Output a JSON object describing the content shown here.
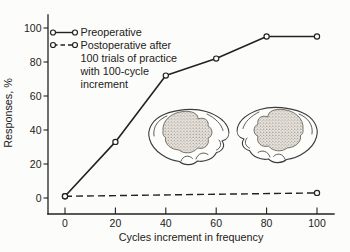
{
  "figure": {
    "paper_color": "#fcfcfa",
    "ink_color": "#222220"
  },
  "chart_data": {
    "type": "line",
    "title": "",
    "xlabel": "Cycles increment in frequency",
    "ylabel": "Responses, %",
    "xlim": [
      0,
      100
    ],
    "ylim": [
      0,
      100
    ],
    "x_ticks": [
      0,
      20,
      40,
      60,
      80,
      100
    ],
    "y_ticks": [
      0,
      20,
      40,
      60,
      80,
      100
    ],
    "grid": false,
    "legend_position": "top-left",
    "series": [
      {
        "name": "Preoperative",
        "line_style": "solid",
        "marker": "open-circle",
        "x": [
          0,
          20,
          40,
          60,
          80,
          100
        ],
        "y": [
          1,
          33,
          72,
          82,
          95,
          95
        ]
      },
      {
        "name": "Postoperative after 100 trials of practice with 100-cycle increment",
        "line_style": "dashed",
        "marker": "open-circle",
        "x": [
          0,
          100
        ],
        "y": [
          1,
          3
        ]
      }
    ]
  },
  "legend": {
    "entries": [
      {
        "label_lines": [
          "Preoperative"
        ]
      },
      {
        "label_lines": [
          "Postoperative after",
          "100 trials of practice",
          "with 100-cycle",
          "increment"
        ]
      }
    ]
  },
  "illustrations": {
    "left": "cat-brain-lateral-view-stippled-lesion",
    "right": "cat-brain-lateral-view-stippled-lesion-mirrored"
  }
}
